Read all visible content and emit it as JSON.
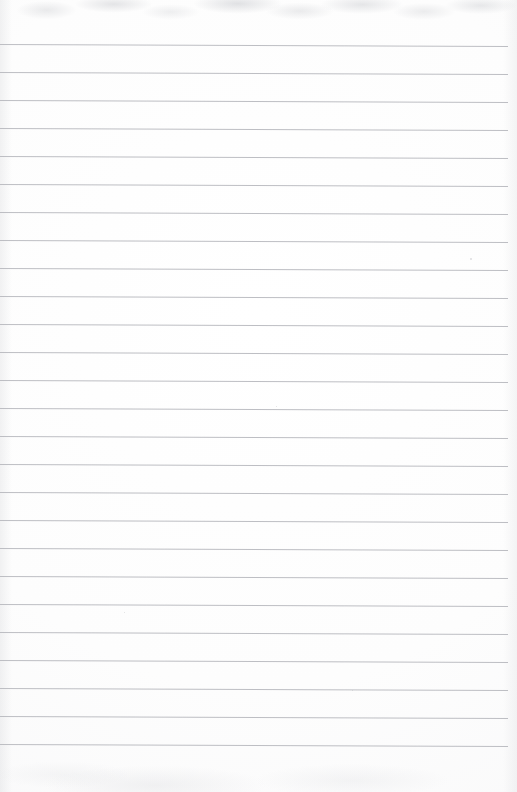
{
  "document": {
    "type": "ruled-notebook-paper",
    "title": "Blank lined notebook page",
    "content_text": "",
    "page_width": 517,
    "page_height": 792,
    "paper_color": "#fdfdfd",
    "rule_color": "#b9bbc0",
    "has_margin_rule": false,
    "is_blank": true
  },
  "ruling": {
    "line_count": 26,
    "first_line_y": 44,
    "line_spacing": 28,
    "line_thickness": 1,
    "line_start_x": 0,
    "line_end_x": 508,
    "skew_px": 2,
    "top_margin": 44,
    "bottom_margin": 58
  },
  "scan_artifacts": {
    "top_mottle": true,
    "bottom_wash": true,
    "edge_shading": true,
    "specks": [
      {
        "x": 470,
        "y": 258,
        "size": 2
      },
      {
        "x": 276,
        "y": 406,
        "size": 1
      },
      {
        "x": 124,
        "y": 612,
        "size": 1
      },
      {
        "x": 352,
        "y": 690,
        "size": 1
      }
    ]
  }
}
